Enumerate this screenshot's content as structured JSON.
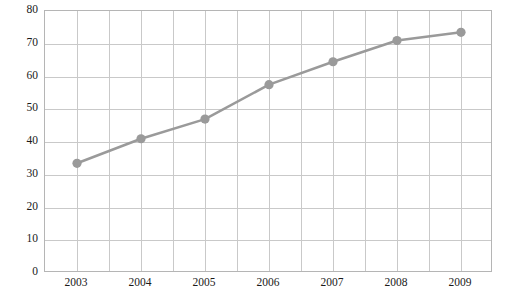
{
  "chart_data": {
    "type": "line",
    "title": "",
    "subtitle": "",
    "xlabel": "",
    "ylabel": "",
    "categories": [
      "2003",
      "2004",
      "2005",
      "2006",
      "2007",
      "2008",
      "2009"
    ],
    "values": [
      33.5,
      41,
      47,
      57.5,
      64.5,
      71,
      73.5
    ],
    "series": [
      {
        "name": "",
        "values": [
          33.5,
          41,
          47,
          57.5,
          64.5,
          71,
          73.5
        ],
        "color": "#9a9a9a",
        "marker": "circle",
        "line_width": 2.5
      }
    ],
    "ylim": [
      0,
      80
    ],
    "yticks": [
      0,
      10,
      20,
      30,
      40,
      50,
      60,
      70,
      80
    ],
    "ytick_labels": [
      "0",
      "10",
      "20",
      "30",
      "40",
      "50",
      "60",
      "70",
      "80"
    ],
    "xtick_labels": [
      "2003",
      "2004",
      "2005",
      "2006",
      "2007",
      "2008",
      "2009"
    ],
    "grid": true,
    "grid_color": "#c9c9c9",
    "minor_vertical_gridlines": 14,
    "legend": false,
    "legend_position": "none",
    "frame_color": "#b5b5b5",
    "background": "#ffffff",
    "annotations": []
  }
}
